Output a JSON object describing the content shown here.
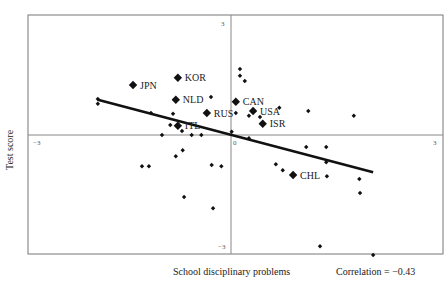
{
  "chart_data": {
    "type": "scatter",
    "title": "",
    "xlabel": "School disciplinary problems",
    "ylabel": "Test score",
    "annotation": "Correlation = −0.43",
    "correlation": -0.43,
    "xlim": [
      -3,
      3
    ],
    "ylim": [
      -3,
      3
    ],
    "x_ticks": [
      "−3",
      "3"
    ],
    "y_ticks": [
      "3",
      "−3"
    ],
    "center_tick": "0",
    "grid": false,
    "legend": null,
    "labeled_points": [
      {
        "label": "JPN",
        "x": -1.42,
        "y": 1.25
      },
      {
        "label": "KOR",
        "x": -0.77,
        "y": 1.43
      },
      {
        "label": "NLD",
        "x": -0.8,
        "y": 0.88
      },
      {
        "label": "ITL",
        "x": -0.77,
        "y": 0.23
      },
      {
        "label": "RUS",
        "x": -0.35,
        "y": 0.55
      },
      {
        "label": "CAN",
        "x": 0.07,
        "y": 0.83
      },
      {
        "label": "USA",
        "x": 0.32,
        "y": 0.6
      },
      {
        "label": "ISR",
        "x": 0.46,
        "y": 0.28
      },
      {
        "label": "CHL",
        "x": 0.9,
        "y": -1.0
      }
    ],
    "points": [
      {
        "x": -1.93,
        "y": 0.9
      },
      {
        "x": -1.93,
        "y": 0.78
      },
      {
        "x": -1.16,
        "y": 0.55
      },
      {
        "x": -0.84,
        "y": 0.53
      },
      {
        "x": -0.88,
        "y": 0.25
      },
      {
        "x": -0.71,
        "y": 0.1
      },
      {
        "x": -1.0,
        "y": 0.0
      },
      {
        "x": -0.57,
        "y": 0.0
      },
      {
        "x": -0.43,
        "y": 0.0
      },
      {
        "x": -0.29,
        "y": 0.95
      },
      {
        "x": 0.13,
        "y": 1.65
      },
      {
        "x": 0.13,
        "y": 1.48
      },
      {
        "x": 0.2,
        "y": 1.35
      },
      {
        "x": 0.07,
        "y": 0.55
      },
      {
        "x": 0.26,
        "y": 0.48
      },
      {
        "x": 0.42,
        "y": 0.45
      },
      {
        "x": 0.7,
        "y": 0.68
      },
      {
        "x": 1.12,
        "y": 0.6
      },
      {
        "x": 1.78,
        "y": 0.48
      },
      {
        "x": 0.01,
        "y": 0.08
      },
      {
        "x": 0.26,
        "y": -0.08
      },
      {
        "x": -1.29,
        "y": -0.78
      },
      {
        "x": -1.19,
        "y": -0.78
      },
      {
        "x": -0.8,
        "y": -0.53
      },
      {
        "x": -0.7,
        "y": -0.38
      },
      {
        "x": -0.28,
        "y": -0.75
      },
      {
        "x": -0.14,
        "y": -0.78
      },
      {
        "x": -0.68,
        "y": -1.55
      },
      {
        "x": -0.26,
        "y": -1.83
      },
      {
        "x": 0.65,
        "y": -0.73
      },
      {
        "x": 0.75,
        "y": -0.88
      },
      {
        "x": 1.38,
        "y": -0.68
      },
      {
        "x": 1.39,
        "y": -1.03
      },
      {
        "x": 1.86,
        "y": -1.1
      },
      {
        "x": 1.87,
        "y": -1.45
      },
      {
        "x": 1.29,
        "y": -2.78
      },
      {
        "x": 2.06,
        "y": -3.0
      },
      {
        "x": 1.09,
        "y": -0.3
      },
      {
        "x": 1.38,
        "y": -0.3
      }
    ],
    "regression_line": {
      "x1": -1.93,
      "y1": 0.88,
      "x2": 2.06,
      "y2": -0.93
    }
  }
}
